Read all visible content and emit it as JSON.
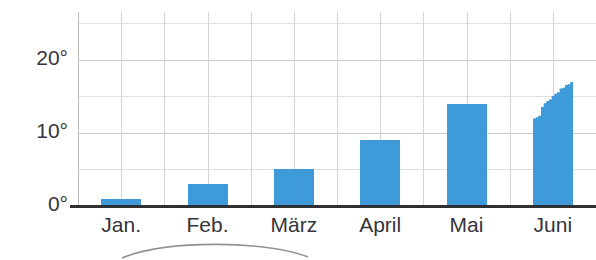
{
  "chart_data": {
    "type": "bar",
    "title": "",
    "xlabel": "",
    "ylabel": "",
    "categories": [
      "Jan.",
      "Feb.",
      "März",
      "April",
      "Mai",
      "Juni"
    ],
    "values": [
      1,
      3,
      5,
      9,
      14,
      17
    ],
    "value_suffix": "°",
    "ylim": [
      0,
      26.5
    ],
    "yticks": [
      0,
      10,
      20
    ],
    "ytick_labels": [
      "0°",
      "10°",
      "20°"
    ],
    "gridlines_y": [
      0,
      5,
      10,
      15,
      20,
      25
    ],
    "grid": true,
    "legend": "none",
    "series": [
      {
        "name": "Monatstemperatur",
        "values": [
          1,
          3,
          5,
          9,
          14,
          17
        ],
        "color": "#3f9ad9"
      }
    ],
    "partial_bar": {
      "category": "Juni",
      "note": "stepped rising top edge",
      "step_values": [
        12,
        12.2,
        12.4,
        13.6,
        14.1,
        14.4,
        14.6,
        15.1,
        15.4,
        15.6,
        16.1,
        16.2,
        16.6,
        16.7,
        17.0
      ]
    },
    "axis_color": "#2f2f33",
    "grid_color": "#d3d5d7",
    "bar_color": "#3f9ad9",
    "text_color": "#35353a",
    "background": "#ffffff"
  }
}
